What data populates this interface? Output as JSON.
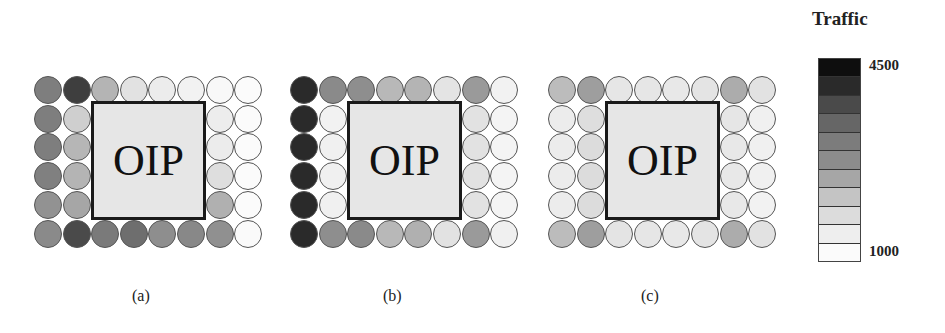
{
  "figure": {
    "node_label": "OIP",
    "grid": {
      "cols": 8,
      "rows": 6,
      "oip_cols": [
        2,
        5
      ],
      "oip_rows": [
        1,
        4
      ]
    }
  },
  "legend": {
    "title": "Traffic",
    "max_label": "4500",
    "min_label": "1000",
    "segments": [
      "#0e0e0e",
      "#2a2a2a",
      "#4a4a4a",
      "#666666",
      "#7c7c7c",
      "#8c8c8c",
      "#a6a6a6",
      "#c4c4c4",
      "#dcdcdc",
      "#eeeeee",
      "#fbfbfb"
    ]
  },
  "panels": [
    {
      "label": "(a)",
      "left": 34,
      "colors": [
        [
          "#7e7e7e",
          "#3e3e3e",
          "#b4b4b4",
          "#e2e2e2",
          "#ececec",
          "#f2f2f2",
          "#f8f8f8",
          "#fbfbfb"
        ],
        [
          "#7e7e7e",
          "#cfcfcf",
          null,
          null,
          null,
          null,
          "#ededed",
          "#fbfbfb"
        ],
        [
          "#7e7e7e",
          "#b6b6b6",
          null,
          null,
          null,
          null,
          "#ececec",
          "#fbfbfb"
        ],
        [
          "#808080",
          "#b4b4b4",
          null,
          null,
          null,
          null,
          "#dedede",
          "#fbfbfb"
        ],
        [
          "#929292",
          "#a6a6a6",
          null,
          null,
          null,
          null,
          "#b0b0b0",
          "#fbfbfb"
        ],
        [
          "#8a8a8a",
          "#4a4a4a",
          "#7a7a7a",
          "#6e6e6e",
          "#8e8e8e",
          "#888888",
          "#909090",
          "#fafafa"
        ]
      ]
    },
    {
      "label": "(b)",
      "left": 290,
      "colors": [
        [
          "#2a2a2a",
          "#8a8a8a",
          "#8e8e8e",
          "#b8b8b8",
          "#b4b4b4",
          "#e4e4e4",
          "#9a9a9a",
          "#f2f2f2"
        ],
        [
          "#2a2a2a",
          "#f2f2f2",
          null,
          null,
          null,
          null,
          "#e2e2e2",
          "#f4f4f4"
        ],
        [
          "#2a2a2a",
          "#f0f0f0",
          null,
          null,
          null,
          null,
          "#e2e2e2",
          "#f4f4f4"
        ],
        [
          "#2a2a2a",
          "#f0f0f0",
          null,
          null,
          null,
          null,
          "#e2e2e2",
          "#f4f4f4"
        ],
        [
          "#2a2a2a",
          "#f0f0f0",
          null,
          null,
          null,
          null,
          "#e2e2e2",
          "#f4f4f4"
        ],
        [
          "#2a2a2a",
          "#8e8e8e",
          "#8a8a8a",
          "#b8b8b8",
          "#b0b0b0",
          "#e2e2e2",
          "#9a9a9a",
          "#f0f0f0"
        ]
      ]
    },
    {
      "label": "(c)",
      "left": 548,
      "colors": [
        [
          "#bcbcbc",
          "#9e9e9e",
          "#e6e6e6",
          "#e6e6e6",
          "#e8e8e8",
          "#e4e4e4",
          "#acacac",
          "#e2e2e2"
        ],
        [
          "#ececec",
          "#dedede",
          null,
          null,
          null,
          null,
          "#e6e6e6",
          "#f0f0f0"
        ],
        [
          "#ececec",
          "#dcdcdc",
          null,
          null,
          null,
          null,
          "#e8e8e8",
          "#f0f0f0"
        ],
        [
          "#ececec",
          "#dcdcdc",
          null,
          null,
          null,
          null,
          "#e8e8e8",
          "#f0f0f0"
        ],
        [
          "#ececec",
          "#dcdcdc",
          null,
          null,
          null,
          null,
          "#e8e8e8",
          "#f2f2f2"
        ],
        [
          "#bcbcbc",
          "#9e9e9e",
          "#e4e4e4",
          "#e6e6e6",
          "#e8e8e8",
          "#e4e4e4",
          "#acacac",
          "#e2e2e2"
        ]
      ]
    }
  ],
  "chart_data": {
    "type": "heatmap",
    "title": "Traffic",
    "colorbar": {
      "min": 1000,
      "max": 4500,
      "label_min": "1000",
      "label_max": "4500",
      "segments": 11
    },
    "panel_labels": [
      "(a)",
      "(b)",
      "(c)"
    ],
    "oip_region": {
      "cols": [
        2,
        5
      ],
      "rows": [
        1,
        4
      ]
    },
    "approx_values": {
      "(a)": [
        [
          3000,
          4000,
          2200,
          1500,
          1300,
          1200,
          1100,
          1000
        ],
        [
          3000,
          1800,
          null,
          null,
          null,
          null,
          1300,
          1000
        ],
        [
          3000,
          2200,
          null,
          null,
          null,
          null,
          1300,
          1000
        ],
        [
          3000,
          2200,
          null,
          null,
          null,
          null,
          1500,
          1000
        ],
        [
          2700,
          2500,
          null,
          null,
          null,
          null,
          2300,
          1000
        ],
        [
          2800,
          3800,
          3100,
          3300,
          2800,
          2900,
          2800,
          1000
        ]
      ],
      "(b)": [
        [
          4200,
          2900,
          2800,
          2100,
          2200,
          1400,
          2600,
          1200
        ],
        [
          4200,
          1200,
          null,
          null,
          null,
          null,
          1400,
          1100
        ],
        [
          4200,
          1200,
          null,
          null,
          null,
          null,
          1400,
          1100
        ],
        [
          4200,
          1200,
          null,
          null,
          null,
          null,
          1400,
          1100
        ],
        [
          4200,
          1200,
          null,
          null,
          null,
          null,
          1400,
          1100
        ],
        [
          4200,
          2800,
          2900,
          2100,
          2300,
          1400,
          2600,
          1200
        ]
      ],
      "(c)": [
        [
          2000,
          2500,
          1400,
          1400,
          1300,
          1400,
          2300,
          1500
        ],
        [
          1300,
          1500,
          null,
          null,
          null,
          null,
          1400,
          1200
        ],
        [
          1300,
          1500,
          null,
          null,
          null,
          null,
          1300,
          1200
        ],
        [
          1300,
          1500,
          null,
          null,
          null,
          null,
          1300,
          1200
        ],
        [
          1300,
          1500,
          null,
          null,
          null,
          null,
          1300,
          1200
        ],
        [
          2000,
          2500,
          1400,
          1400,
          1300,
          1400,
          2300,
          1500
        ]
      ]
    }
  }
}
